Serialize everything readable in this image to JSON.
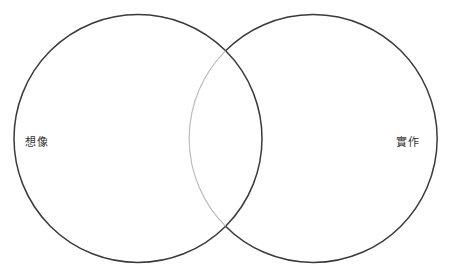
{
  "diagram": {
    "type": "venn",
    "sets": [
      {
        "id": "left",
        "label": "想像"
      },
      {
        "id": "right",
        "label": "實作"
      }
    ],
    "intersection_label": ""
  },
  "colors": {
    "background": "#ffffff",
    "stroke": "#3a3a3a",
    "inner_arc": "#bdbdbd",
    "label": "#333333"
  }
}
